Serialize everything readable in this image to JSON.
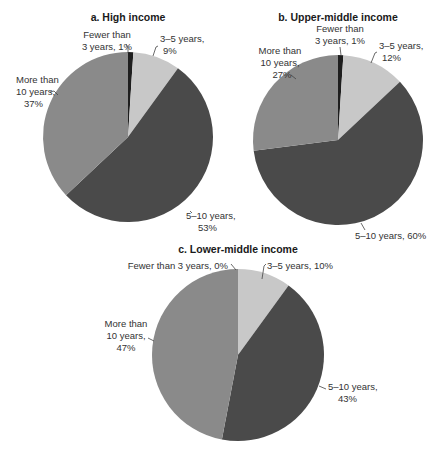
{
  "colors": {
    "fewer_than_3": "#1e1e1e",
    "3_5": "#c8c8c8",
    "5_10": "#4a4a4a",
    "more_than_10": "#8a8a8a"
  },
  "chart_data": [
    {
      "type": "pie",
      "title": "a. High income",
      "categories": [
        "Fewer than 3 years",
        "3–5 years",
        "5–10 years",
        "More than 10 years"
      ],
      "values": [
        1,
        9,
        53,
        37
      ],
      "labels": [
        "Fewer than 3 years, 1%",
        "3–5 years, 9%",
        "5–10 years, 53%",
        "More than 10 years, 37%"
      ]
    },
    {
      "type": "pie",
      "title": "b. Upper-middle income",
      "categories": [
        "Fewer than 3 years",
        "3–5 years",
        "5–10 years",
        "More than 10 years"
      ],
      "values": [
        1,
        12,
        60,
        27
      ],
      "labels": [
        "Fewer than 3 years, 1%",
        "3–5 years, 12%",
        "5–10 years, 60%",
        "More than 10 years, 27%"
      ]
    },
    {
      "type": "pie",
      "title": "c. Lower-middle income",
      "categories": [
        "Fewer than 3 years",
        "3–5 years",
        "5–10 years",
        "More than 10 years"
      ],
      "values": [
        0,
        10,
        43,
        47
      ],
      "labels": [
        "Fewer than 3 years, 0%",
        "3–5 years, 10%",
        "5–10 years, 43%",
        "More than 10 years, 47%"
      ]
    }
  ],
  "text": {
    "a": {
      "title": "a. High income",
      "fewer_l1": "Fewer than",
      "fewer_l2": "3 years, 1%",
      "t35_l1": "3–5 years,",
      "t35_l2": "9%",
      "t510_l1": "5–10 years,",
      "t510_l2": "53%",
      "more_l1": "More than",
      "more_l2": "10 years,",
      "more_l3": "37%"
    },
    "b": {
      "title": "b. Upper-middle income",
      "fewer_l1": "Fewer than",
      "fewer_l2": "3 years, 1%",
      "t35_l1": "3–5 years,",
      "t35_l2": "12%",
      "t510_l1": "5–10 years, 60%",
      "more_l1": "More than",
      "more_l2": "10 years,",
      "more_l3": "27%"
    },
    "c": {
      "title": "c. Lower-middle income",
      "fewer_l1": "Fewer than 3 years, 0%",
      "t35_l1": "3–5 years, 10%",
      "t510_l1": "5–10 years,",
      "t510_l2": "43%",
      "more_l1": "More than",
      "more_l2": "10 years,",
      "more_l3": "47%"
    }
  }
}
